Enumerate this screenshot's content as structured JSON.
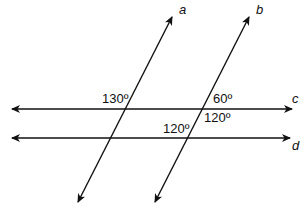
{
  "diagram": {
    "type": "parallel lines and transversals",
    "lines": [
      {
        "name": "a",
        "x1": 172,
        "y1": 17,
        "x2": 78,
        "y2": 202,
        "label_x": 179,
        "label_y": 14
      },
      {
        "name": "b",
        "x1": 249,
        "y1": 17,
        "x2": 155,
        "y2": 202,
        "label_x": 256,
        "label_y": 14
      },
      {
        "name": "c",
        "x1": 12,
        "y1": 109,
        "x2": 292,
        "y2": 109,
        "label_x": 292,
        "label_y": 103
      },
      {
        "name": "d",
        "x1": 12,
        "y1": 138,
        "x2": 290,
        "y2": 138,
        "label_x": 292,
        "label_y": 150
      }
    ],
    "angles": [
      {
        "value": "130º",
        "x": 102,
        "y": 103
      },
      {
        "value": "60º",
        "x": 213,
        "y": 103
      },
      {
        "value": "120º",
        "x": 204,
        "y": 122
      },
      {
        "value": "120º",
        "x": 163,
        "y": 133
      }
    ],
    "stroke_color": "#111111"
  }
}
